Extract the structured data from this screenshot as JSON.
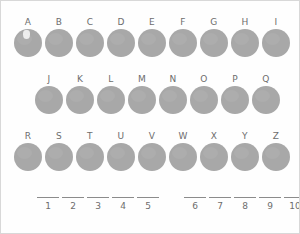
{
  "worksheet": {
    "type": "symbol-decoder-puzzle",
    "ink_color": "#a8a8a8",
    "text_color": "#6d6d6d",
    "background_color": "#fefefe"
  },
  "alphabet_grid": {
    "rows": [
      {
        "row_label": "row-1",
        "cells": [
          {
            "letter": "A",
            "marked": true
          },
          {
            "letter": "B",
            "marked": false
          },
          {
            "letter": "C",
            "marked": false
          },
          {
            "letter": "D",
            "marked": false
          },
          {
            "letter": "E",
            "marked": false
          },
          {
            "letter": "F",
            "marked": false
          },
          {
            "letter": "G",
            "marked": false
          },
          {
            "letter": "H",
            "marked": false
          },
          {
            "letter": "I",
            "marked": false
          }
        ]
      },
      {
        "row_label": "row-2",
        "cells": [
          {
            "letter": "J",
            "marked": false
          },
          {
            "letter": "K",
            "marked": false
          },
          {
            "letter": "L",
            "marked": false
          },
          {
            "letter": "M",
            "marked": false
          },
          {
            "letter": "N",
            "marked": false
          },
          {
            "letter": "O",
            "marked": false
          },
          {
            "letter": "P",
            "marked": false
          },
          {
            "letter": "Q",
            "marked": false
          }
        ]
      },
      {
        "row_label": "row-3",
        "cells": [
          {
            "letter": "R",
            "marked": false
          },
          {
            "letter": "S",
            "marked": false
          },
          {
            "letter": "T",
            "marked": false
          },
          {
            "letter": "U",
            "marked": false
          },
          {
            "letter": "V",
            "marked": false
          },
          {
            "letter": "W",
            "marked": false
          },
          {
            "letter": "X",
            "marked": false
          },
          {
            "letter": "Y",
            "marked": false
          },
          {
            "letter": "Z",
            "marked": false
          }
        ]
      }
    ]
  },
  "answer_blanks": {
    "groups": [
      {
        "group_label": "group-a",
        "blanks": [
          {
            "number": "1",
            "value": ""
          },
          {
            "number": "2",
            "value": ""
          },
          {
            "number": "3",
            "value": ""
          },
          {
            "number": "4",
            "value": ""
          },
          {
            "number": "5",
            "value": ""
          }
        ]
      },
      {
        "group_label": "group-b",
        "blanks": [
          {
            "number": "6",
            "value": ""
          },
          {
            "number": "7",
            "value": ""
          },
          {
            "number": "8",
            "value": ""
          },
          {
            "number": "9",
            "value": ""
          },
          {
            "number": "10",
            "value": ""
          }
        ]
      }
    ]
  }
}
